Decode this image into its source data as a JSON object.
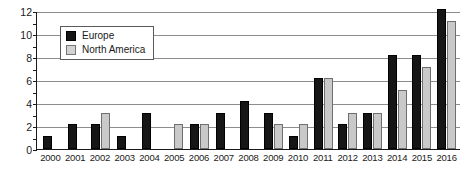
{
  "chart_data": {
    "type": "bar",
    "title": "",
    "subtitle": "",
    "xlabel": "",
    "ylabel": "",
    "ylim": [
      0,
      12
    ],
    "ytick_step": 2,
    "yticks": [
      0,
      2,
      4,
      6,
      8,
      10,
      12
    ],
    "grid": true,
    "legend_position": "upper-left-inside",
    "categories": [
      "2000",
      "2001",
      "2002",
      "2003",
      "2004",
      "2005",
      "2006",
      "2007",
      "2008",
      "2009",
      "2010",
      "2011",
      "2012",
      "2013",
      "2014",
      "2015",
      "2016"
    ],
    "series": [
      {
        "name": "Europe",
        "color": "#161616",
        "values": [
          1,
          2,
          2,
          1,
          3,
          0,
          2,
          3,
          4,
          3,
          1,
          6,
          2,
          3,
          8,
          8,
          12
        ]
      },
      {
        "name": "North America",
        "color": "#c9c9c9",
        "values": [
          0,
          0,
          3,
          0,
          0,
          2,
          2,
          0,
          0,
          2,
          2,
          6,
          3,
          3,
          5,
          7,
          11
        ]
      }
    ]
  },
  "legend": {
    "items": [
      {
        "label": "Europe",
        "swatch": "black-square-icon"
      },
      {
        "label": "North America",
        "swatch": "gray-square-icon"
      }
    ]
  },
  "axes": {
    "y_tick_labels": [
      "12",
      "10",
      "8",
      "6",
      "4",
      "2",
      "0"
    ],
    "x_tick_labels": [
      "2000",
      "2001",
      "2002",
      "2003",
      "2004",
      "2005",
      "2006",
      "2007",
      "2008",
      "2009",
      "2010",
      "2011",
      "2012",
      "2013",
      "2014",
      "2015",
      "2016"
    ]
  },
  "colors": {
    "series_europe": "#161616",
    "series_north_america": "#c9c9c9",
    "gridline": "#8d8d8d",
    "axis": "#1a1a1a",
    "background": "#ffffff"
  }
}
